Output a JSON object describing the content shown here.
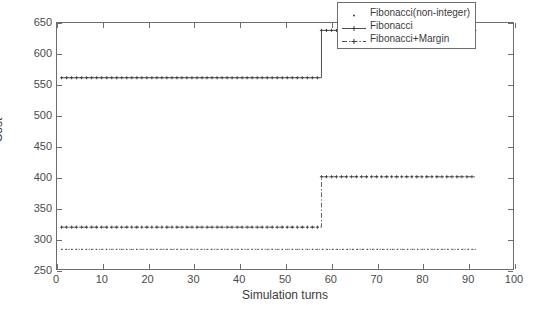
{
  "chart_data": {
    "type": "line",
    "title": "",
    "xlabel": "Simulation turns",
    "ylabel": "Cost",
    "xlim": [
      0,
      100
    ],
    "ylim": [
      250,
      650
    ],
    "xticks": [
      0,
      10,
      20,
      30,
      40,
      50,
      60,
      70,
      80,
      90,
      100
    ],
    "yticks": [
      250,
      300,
      350,
      400,
      450,
      500,
      550,
      600,
      650
    ],
    "grid": false,
    "legend_position": "top-right",
    "series": [
      {
        "name": "Fibonacci(non-integer)",
        "style": "dotted",
        "marker": "dot",
        "color": "#3b3b3b",
        "x": [
          1,
          92
        ],
        "values": [
          282,
          282
        ],
        "description": "flat constant line at cost 282 from turn 1 to turn 92"
      },
      {
        "name": "Fibonacci",
        "style": "solid",
        "marker": "plus",
        "color": "#3b3b3b",
        "x": [
          1,
          58,
          58,
          92
        ],
        "values": [
          561,
          561,
          638,
          638
        ],
        "description": "step from 561 up to 638 at turn 58"
      },
      {
        "name": "Fibonacci+Margin",
        "style": "dash-dot",
        "marker": "plus",
        "color": "#3b3b3b",
        "x": [
          1,
          58,
          58,
          92
        ],
        "values": [
          318,
          318,
          400,
          400
        ],
        "description": "step from 318 up to 400 at turn 58"
      }
    ]
  },
  "legend": {
    "items": [
      {
        "label": "Fibonacci(non-integer)",
        "sample": "dotted-marker"
      },
      {
        "label": "Fibonacci",
        "sample": "solid-plus"
      },
      {
        "label": "Fibonacci+Margin",
        "sample": "dashdot-plus"
      }
    ]
  },
  "axes": {
    "x_title": "Simulation turns",
    "y_title": "Cost",
    "x_tick_labels": [
      "0",
      "10",
      "20",
      "30",
      "40",
      "50",
      "60",
      "70",
      "80",
      "90",
      "100"
    ],
    "y_tick_labels": [
      "250",
      "300",
      "350",
      "400",
      "450",
      "500",
      "550",
      "600",
      "650"
    ]
  },
  "colors": {
    "axis": "#6d6d6d",
    "ink": "#3b3b3b",
    "background": "#ffffff"
  }
}
